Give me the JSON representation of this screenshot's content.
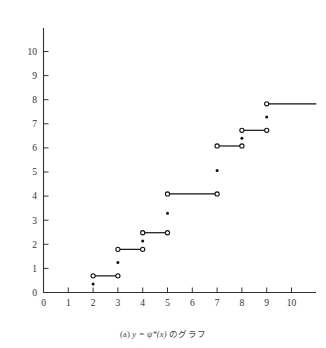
{
  "figure": {
    "caption_prefix": "(a)",
    "caption_math": "y = ψ*(x)",
    "caption_suffix": "のグラフ",
    "caption_full": "(a) y = ψ*(x) のグラフ"
  },
  "colors": {
    "axis": "#333333",
    "line": "#111111",
    "marker_fill": "#111111",
    "marker_open_stroke": "#111111",
    "background": "#ffffff"
  },
  "chart_data": {
    "type": "line",
    "title": "",
    "subtitle": "",
    "xlabel": "",
    "ylabel": "",
    "xlim": [
      0,
      11.0
    ],
    "ylim": [
      0,
      10.9
    ],
    "xticks": [
      0,
      1,
      2,
      3,
      4,
      5,
      6,
      7,
      8,
      9,
      10
    ],
    "yticks": [
      0,
      1,
      2,
      3,
      4,
      5,
      6,
      7,
      8,
      9,
      10
    ],
    "xtick_labels": [
      "0",
      "1",
      "2",
      "3",
      "4",
      "5",
      "6",
      "7",
      "8",
      "9",
      "10"
    ],
    "ytick_labels": [
      "0",
      "1",
      "2",
      "3",
      "4",
      "5",
      "6",
      "7",
      "8",
      "9",
      "10"
    ],
    "grid": false,
    "legend": null,
    "legend_position": "none",
    "series": [
      {
        "name": "psi-star step segments",
        "style": "step-segment-open-endpoints",
        "segments": [
          {
            "x0": 2,
            "x1": 3,
            "y": 0.69,
            "open_left": true,
            "open_right": true
          },
          {
            "x0": 3,
            "x1": 4,
            "y": 1.79,
            "open_left": true,
            "open_right": true
          },
          {
            "x0": 4,
            "x1": 5,
            "y": 2.48,
            "open_left": true,
            "open_right": true
          },
          {
            "x0": 5,
            "x1": 7,
            "y": 4.09,
            "open_left": true,
            "open_right": true
          },
          {
            "x0": 7,
            "x1": 8,
            "y": 6.08,
            "open_left": true,
            "open_right": true
          },
          {
            "x0": 8,
            "x1": 9,
            "y": 6.73,
            "open_left": true,
            "open_right": true
          },
          {
            "x0": 9,
            "x1": 11.0,
            "y": 7.83,
            "open_left": true,
            "open_right": false
          }
        ]
      },
      {
        "name": "jump midpoint dots",
        "style": "filled-dot",
        "points": [
          {
            "x": 2,
            "y": 0.35
          },
          {
            "x": 3,
            "y": 1.24
          },
          {
            "x": 4,
            "y": 2.14
          },
          {
            "x": 5,
            "y": 3.29
          },
          {
            "x": 7,
            "y": 5.06
          },
          {
            "x": 8,
            "y": 6.4
          },
          {
            "x": 9,
            "y": 7.28
          }
        ]
      }
    ]
  }
}
